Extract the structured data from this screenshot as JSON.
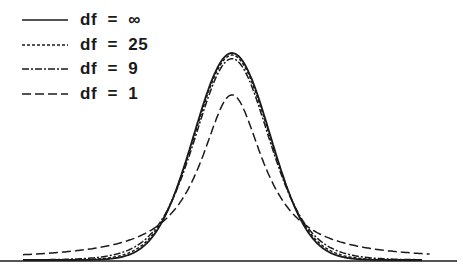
{
  "chart_data": {
    "type": "line",
    "title": "",
    "xlabel": "",
    "ylabel": "",
    "grid": false,
    "legend_position": "top-left",
    "xlim": [
      -4.5,
      4.5
    ],
    "ylim": [
      0,
      0.42
    ],
    "series": [
      {
        "name": "df = ∞",
        "df": null,
        "style": "solid",
        "dasharray": "",
        "peak": 0.399
      },
      {
        "name": "df = 25",
        "df": 25,
        "style": "dotted",
        "dasharray": "3,2",
        "peak": 0.394
      },
      {
        "name": "df = 9",
        "df": 9,
        "style": "dash-dot",
        "dasharray": "7,2,2,2",
        "peak": 0.387
      },
      {
        "name": "df = 1",
        "df": 1,
        "style": "dashed",
        "dasharray": "9,4",
        "peak": 0.318
      }
    ]
  },
  "legend": {
    "items": [
      {
        "label": "df  =  ∞"
      },
      {
        "label": "df  =  25"
      },
      {
        "label": "df  =  9"
      },
      {
        "label": "df  =  1"
      }
    ]
  },
  "colors": {
    "line": "#1a1a1a",
    "axis": "#555555",
    "background": "#ffffff"
  }
}
